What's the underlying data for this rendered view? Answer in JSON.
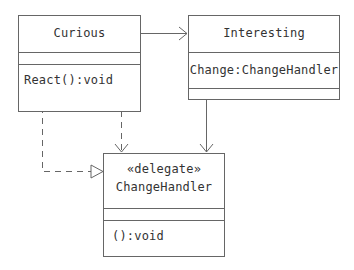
{
  "diagram": {
    "type": "uml-class-diagram",
    "classes": [
      {
        "id": "curious",
        "name": "Curious",
        "stereotype": null,
        "attributes": [],
        "operations": [
          "React():void"
        ]
      },
      {
        "id": "interesting",
        "name": "Interesting",
        "stereotype": null,
        "attributes": [
          "Change:ChangeHandler"
        ],
        "operations": []
      },
      {
        "id": "changehandler",
        "name": "ChangeHandler",
        "stereotype": "«delegate»",
        "attributes": [],
        "operations": [
          "():void"
        ]
      }
    ],
    "relationships": [
      {
        "from": "Curious",
        "to": "Interesting",
        "kind": "association",
        "line": "solid",
        "head": "open-arrow"
      },
      {
        "from": "Interesting",
        "to": "ChangeHandler",
        "kind": "association",
        "line": "solid",
        "head": "open-arrow"
      },
      {
        "from": "Curious",
        "to": "ChangeHandler",
        "kind": "dependency",
        "line": "dashed",
        "head": "open-arrow"
      },
      {
        "from": "Curious.React()",
        "to": "ChangeHandler",
        "kind": "realization",
        "line": "dashed",
        "head": "hollow-triangle"
      }
    ],
    "colors": {
      "line": "#666666",
      "text": "#333333",
      "background": "#ffffff"
    }
  }
}
